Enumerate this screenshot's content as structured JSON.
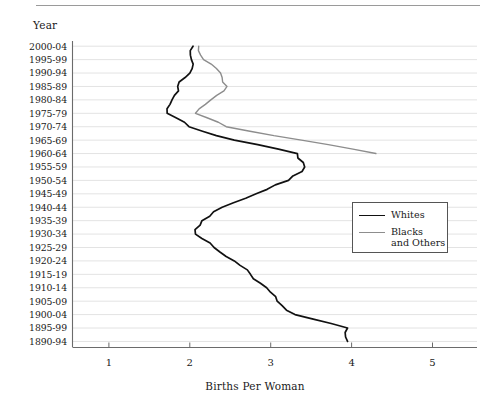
{
  "figure": {
    "y_axis_title": "Year",
    "x_axis_title": "Births Per Woman"
  },
  "legend": {
    "position": "inside-right-middle",
    "entries": [
      {
        "label": "Whites",
        "color": "#111111"
      },
      {
        "label": "Blacks\nand Others",
        "color": "#8d8d8d"
      }
    ]
  },
  "chart_data": {
    "type": "line",
    "orientation": "horizontal",
    "title": "",
    "xlabel": "Births Per Woman",
    "ylabel": "Year",
    "xlim": [
      0.55,
      5.55
    ],
    "xticks": [
      1,
      2,
      3,
      4,
      5
    ],
    "xticklabels": [
      "1",
      "2",
      "3",
      "4",
      "5"
    ],
    "grid": "horizontal",
    "categories": [
      "2000-04",
      "1995-99",
      "1990-94",
      "1985-89",
      "1980-84",
      "1975-79",
      "1970-74",
      "1965-69",
      "1960-64",
      "1955-59",
      "1950-54",
      "1945-49",
      "1940-44",
      "1935-39",
      "1930-34",
      "1925-29",
      "1920-24",
      "1915-19",
      "1910-14",
      "1905-09",
      "1900-04",
      "1895-99",
      "1890-94"
    ],
    "series": [
      {
        "name": "Whites",
        "color": "#111111",
        "values": [
          2.04,
          2.02,
          2.0,
          1.85,
          1.78,
          1.72,
          1.99,
          2.55,
          3.33,
          3.42,
          3.22,
          2.82,
          2.4,
          2.15,
          2.07,
          2.3,
          2.55,
          2.75,
          2.95,
          3.08,
          3.3,
          3.95,
          3.95
        ]
      },
      {
        "name": "Blacks and Others",
        "color": "#8d8d8d",
        "values": [
          2.11,
          2.17,
          2.38,
          2.46,
          2.26,
          2.07,
          2.45,
          3.38,
          4.3,
          null,
          null,
          null,
          null,
          null,
          null,
          null,
          null,
          null,
          null,
          null,
          null,
          null,
          null
        ]
      }
    ]
  }
}
